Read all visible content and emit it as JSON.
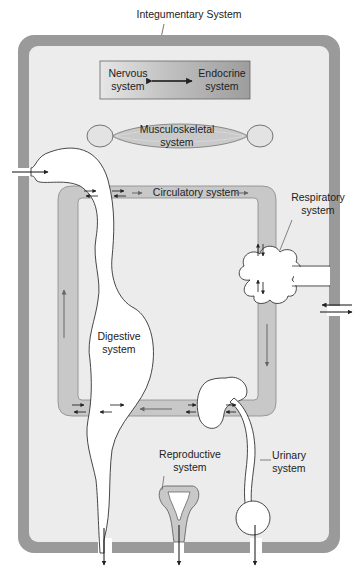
{
  "title": "Integumentary System",
  "labels": {
    "integumentary": "Integumentary System",
    "nervous": [
      "Nervous",
      "system"
    ],
    "endocrine": [
      "Endocrine",
      "system"
    ],
    "musculoskeletal": [
      "Musculoskeletal",
      "system"
    ],
    "respiratory": [
      "Respiratory",
      "system"
    ],
    "circulatory": "Circulatory system",
    "digestive": [
      "Digestive",
      "system"
    ],
    "reproductive": [
      "Reproductive",
      "system"
    ],
    "urinary": [
      "Urinary",
      "system"
    ]
  },
  "colors": {
    "skin_border": "#9a9a9a",
    "body_fill": "#ececec",
    "circulatory_fill": "#c8c8c8",
    "organ_fill": "#ffffff",
    "outline": "#444444",
    "text": "#222222"
  }
}
